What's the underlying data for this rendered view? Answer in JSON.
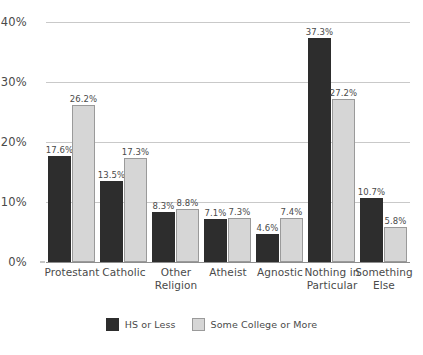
{
  "chart_data": {
    "type": "bar",
    "title": "",
    "subtitle": "",
    "xlabel": "",
    "ylabel": "",
    "ylim": [
      0,
      40
    ],
    "y_ticks": [
      0,
      10,
      20,
      30,
      40
    ],
    "y_tick_labels": [
      "0%",
      "10%",
      "20%",
      "30%",
      "40%"
    ],
    "grid": true,
    "legend_position": "bottom-center",
    "categories": [
      "Protestant",
      "Catholic",
      "Other Religion",
      "Atheist",
      "Agnostic",
      "Nothing in Particular",
      "Something Else"
    ],
    "category_lines": [
      [
        "Protestant"
      ],
      [
        "Catholic"
      ],
      [
        "Other",
        "Religion"
      ],
      [
        "Atheist"
      ],
      [
        "Agnostic"
      ],
      [
        "Nothing in",
        "Particular"
      ],
      [
        "Something",
        "Else"
      ]
    ],
    "series": [
      {
        "name": "HS or Less",
        "color": "#2d2d2d",
        "values": [
          17.6,
          13.5,
          8.3,
          7.1,
          4.6,
          37.3,
          10.7
        ],
        "labels": [
          "17.6%",
          "13.5%",
          "8.3%",
          "7.1%",
          "4.6%",
          "37.3%",
          "10.7%"
        ]
      },
      {
        "name": "Some College or More",
        "color": "#d6d6d6",
        "values": [
          26.2,
          17.3,
          8.8,
          7.3,
          7.4,
          27.2,
          5.8
        ],
        "labels": [
          "26.2%",
          "17.3%",
          "8.8%",
          "7.3%",
          "7.4%",
          "27.2%",
          "5.8%"
        ]
      }
    ]
  },
  "legend": {
    "items": [
      {
        "label": "HS or Less",
        "swatch": "hs"
      },
      {
        "label": "Some College or More",
        "swatch": "college"
      }
    ]
  },
  "colors": {
    "hs_or_less": "#2d2d2d",
    "some_college_or_more": "#d6d6d6",
    "gridline": "#c9c9c9",
    "axis": "#8e8e8e",
    "text": "#4a4a4a",
    "background": "#ffffff"
  }
}
